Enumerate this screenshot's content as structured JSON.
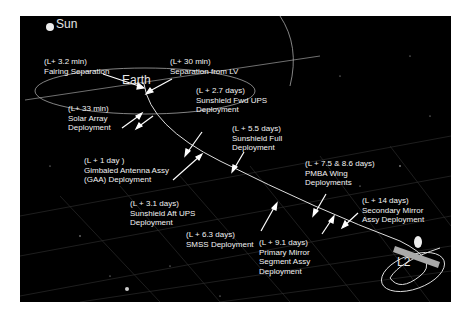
{
  "diagram": {
    "title_bodies": {
      "sun": "Sun",
      "earth": "Earth",
      "l2": "L2"
    },
    "events": [
      {
        "time": "(L+ 3.2 min)",
        "lines": [
          "Fairing Separation"
        ]
      },
      {
        "time": "(L+ 30 min)",
        "lines": [
          "Separation from LV"
        ]
      },
      {
        "time": "(L+ 33 min)",
        "lines": [
          "Solar Array",
          "Deployment"
        ]
      },
      {
        "time": "(L + 2.7 days)",
        "lines": [
          "Sunshield  Fwd UPS",
          "Deployment"
        ]
      },
      {
        "time": "(L + 1 day )",
        "lines": [
          "Gimbaled Antenna  Assy",
          "(GAA) Deployment"
        ]
      },
      {
        "time": "(L + 5.5 days)",
        "lines": [
          "Sunshield Full",
          "Deployment"
        ]
      },
      {
        "time": "(L + 7.5 & 8.6 days)",
        "lines": [
          "PMBA  Wing",
          "Deployments"
        ]
      },
      {
        "time": "(L + 3.1 days)",
        "lines": [
          "Sunshield Aft UPS",
          "Deployment"
        ]
      },
      {
        "time": "(L + 14 days)",
        "lines": [
          "Secondary Mirror",
          "Assy Deployment"
        ]
      },
      {
        "time": "(L + 6.3 days)",
        "lines": [
          "SMSS Deployment"
        ]
      },
      {
        "time": "(L + 9.1 days)",
        "lines": [
          "Primary Mirror",
          "Segment Assy",
          "Deployment"
        ]
      }
    ],
    "colors": {
      "background": "#000000",
      "text": "#f2f2f2",
      "trajectory": "#d8d8d8",
      "grid": "#3a3a3a"
    }
  }
}
